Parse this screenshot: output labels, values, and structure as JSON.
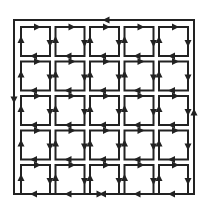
{
  "diagram": {
    "rows": 5,
    "cols": 5,
    "inner_direction": "clockwise",
    "outer_direction": "counter-clockwise",
    "colors": {
      "stroke": "#222222",
      "background": "#ffffff"
    }
  }
}
